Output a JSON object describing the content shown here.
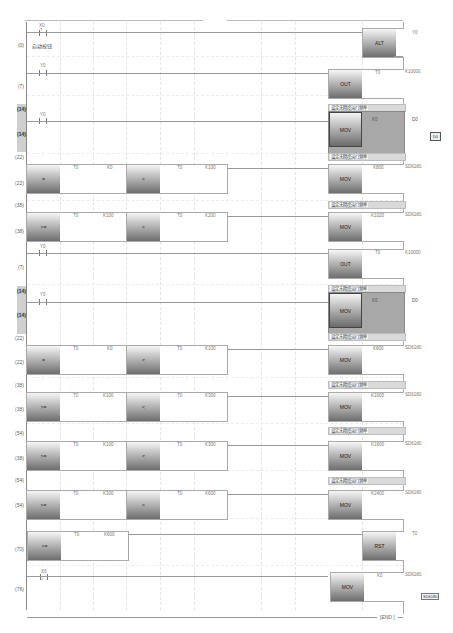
{
  "editor": {
    "type": "ladder-diagram",
    "end_label": "END"
  },
  "steps": {
    "s0": "(0)",
    "s7": "(7)",
    "s14a": "(14)",
    "s14b": "(14)",
    "s22a": "(22)",
    "s22b": "(22)",
    "s38a": "(38)",
    "s38b": "(38)",
    "r2_s7": "(7)",
    "r2_s14a": "(14)",
    "r2_s14b": "(14)",
    "r2_s22a": "(22)",
    "r2_s22b": "(22)",
    "r2_s38a": "(38)",
    "r2_s38b": "(38)",
    "r2_s54a": "(54)",
    "r2_s38c": "(38)",
    "r2_s54b": "(54)",
    "r2_s54c": "(54)",
    "s70a": "(70)",
    "s70b": "(76)"
  },
  "rungs": {
    "r0": {
      "contact": "X0",
      "contact_type": "rising-edge",
      "comment": "启动按钮",
      "instr": "ALT",
      "dst": "Y0"
    },
    "r1": {
      "contact": "Y0",
      "instr": "OUT",
      "dev": "T0",
      "val": "K10000"
    },
    "r2": {
      "contact": "Y0",
      "banner": "设定无精度运行频率",
      "instr": "MOV",
      "src": "K0",
      "dst": "D0",
      "badge": "D0"
    },
    "r3": {
      "banner": "设定无精度运行频率",
      "c1": {
        "op": "=",
        "a": "T0",
        "b": "K0"
      },
      "c2": {
        "op": "<",
        "a": "T0",
        "b": "K100"
      },
      "instr": "MOV",
      "src": "K800",
      "dst": "SD6180"
    },
    "r4": {
      "banner": "设定无精度运行频率",
      "c1": {
        "op": ">=",
        "a": "T0",
        "b": "K100"
      },
      "c2": {
        "op": "<",
        "a": "T0",
        "b": "K200"
      },
      "instr": "MOV",
      "src": "K1020",
      "dst": "SD6180"
    },
    "r5": {
      "contact": "Y0",
      "instr": "OUT",
      "dev": "T0",
      "val": "K10000"
    },
    "r6": {
      "contact": "Y0",
      "banner": "设定无精度运行频率",
      "instr": "MOV",
      "src": "K0",
      "dst": "D0"
    },
    "r7": {
      "banner": "设定无精度运行频率",
      "c1": {
        "op": "=",
        "a": "T0",
        "b": "K0"
      },
      "c2": {
        "op": "<",
        "a": "T0",
        "b": "K100"
      },
      "instr": "MOV",
      "src": "K800",
      "dst": "SD6180"
    },
    "r8": {
      "banner": "设定无精度运行频率",
      "c1": {
        "op": ">=",
        "a": "T0",
        "b": "K100"
      },
      "c2": {
        "op": "<",
        "a": "T0",
        "b": "K300"
      },
      "instr": "MOV",
      "src": "K1600",
      "dst": "SD6180"
    },
    "r9": {
      "banner": "设定无精度运行频率",
      "c1": {
        "op": ">=",
        "a": "T0",
        "b": "K100"
      },
      "c2": {
        "op": "<",
        "a": "T0",
        "b": "K300"
      },
      "instr": "MOV",
      "src": "K1600",
      "dst": "SD6180"
    },
    "r10": {
      "banner": "设定无精度运行频率",
      "c1": {
        "op": ">=",
        "a": "T0",
        "b": "K300"
      },
      "c2": {
        "op": "<",
        "a": "T0",
        "b": "K600"
      },
      "instr": "MOV",
      "src": "K2400",
      "dst": "SD6180"
    },
    "r11": {
      "c1": {
        "op": ">=",
        "a": "T0",
        "b": "K600"
      },
      "instr": "RST",
      "dst": "T0"
    },
    "r12": {
      "contact": "X0",
      "contact_type": "falling-edge",
      "instr": "MOV",
      "src": "K0",
      "dst": "SD6180",
      "tooltip": "SD6180"
    }
  }
}
